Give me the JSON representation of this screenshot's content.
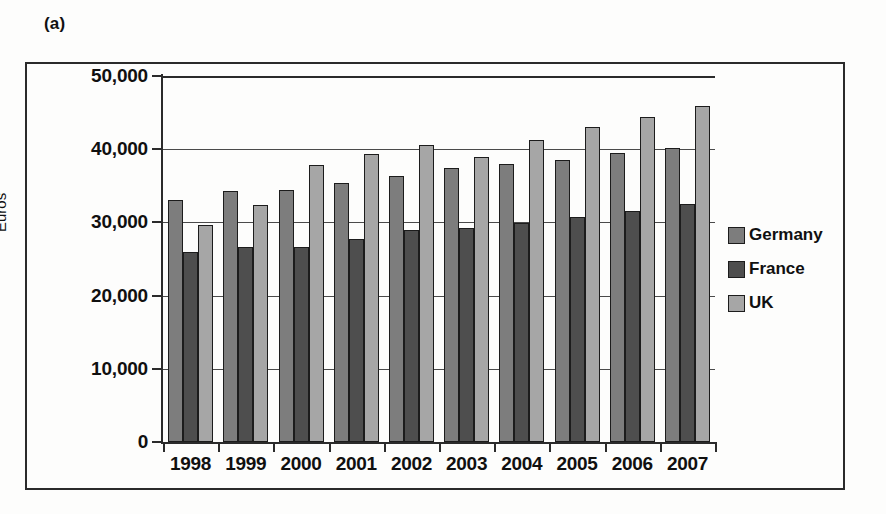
{
  "figure": {
    "panel_label": "(a)"
  },
  "chart_data": {
    "type": "bar",
    "title": "",
    "xlabel": "",
    "ylabel": "Euros",
    "ylim": [
      0,
      50000
    ],
    "ytick_values": [
      50000,
      40000,
      30000,
      20000,
      10000,
      0
    ],
    "ytick_labels": [
      "50,000",
      "40,000",
      "30,000",
      "20,000",
      "10,000",
      "0"
    ],
    "grid": true,
    "legend_position": "right",
    "categories": [
      "1998",
      "1999",
      "2000",
      "2001",
      "2002",
      "2003",
      "2004",
      "2005",
      "2006",
      "2007"
    ],
    "series": [
      {
        "name": "Germany",
        "color": "#7d7d7d",
        "values": [
          33000,
          34300,
          34400,
          35400,
          36400,
          37400,
          38000,
          38500,
          39500,
          40200
        ]
      },
      {
        "name": "France",
        "color": "#4e4e4e",
        "values": [
          25900,
          26600,
          26600,
          27800,
          28900,
          29300,
          29900,
          30800,
          31500,
          32500
        ]
      },
      {
        "name": "UK",
        "color": "#a6a6a6",
        "values": [
          29700,
          32400,
          37900,
          39300,
          40600,
          38900,
          41200,
          43000,
          44400,
          45900
        ]
      }
    ]
  },
  "legend": {
    "items": [
      {
        "label": "Germany",
        "key": "germany"
      },
      {
        "label": "France",
        "key": "france"
      },
      {
        "label": "UK",
        "key": "uk"
      }
    ]
  }
}
